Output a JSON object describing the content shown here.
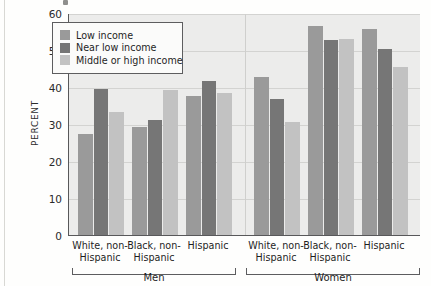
{
  "chart_data": {
    "type": "bar",
    "title": "",
    "xlabel": "",
    "ylabel": "PERCENT",
    "ylim": [
      0,
      60
    ],
    "yticks": [
      0,
      10,
      20,
      30,
      40,
      50,
      60
    ],
    "grid": true,
    "legend_position": "top-left-inside",
    "categories": [
      "White, non-Hispanic",
      "Black, non-Hispanic",
      "Hispanic",
      "White, non-Hispanic",
      "Black, non-Hispanic",
      "Hispanic"
    ],
    "category_lines": [
      [
        "White, non-",
        "Hispanic"
      ],
      [
        "Black, non-",
        "Hispanic"
      ],
      [
        "Hispanic",
        ""
      ],
      [
        "White, non-",
        "Hispanic"
      ],
      [
        "Black, non-",
        "Hispanic"
      ],
      [
        "Hispanic",
        ""
      ]
    ],
    "supergroups": [
      {
        "label": "Men",
        "categories": [
          0,
          1,
          2
        ]
      },
      {
        "label": "Women",
        "categories": [
          3,
          4,
          5
        ]
      }
    ],
    "series": [
      {
        "name": "Low income",
        "color": "#9a9a9a",
        "values": [
          27.3,
          29.2,
          37.6,
          42.7,
          56.5,
          55.7
        ]
      },
      {
        "name": "Near low income",
        "color": "#767676",
        "values": [
          39.5,
          31.1,
          41.6,
          36.8,
          52.7,
          50.3
        ]
      },
      {
        "name": "Middle or high income",
        "color": "#c2c2c2",
        "values": [
          33.2,
          39.2,
          38.4,
          30.5,
          53.0,
          45.4
        ]
      }
    ]
  },
  "axis": {
    "y_title": "PERCENT",
    "y_tick_labels": [
      "60",
      "50",
      "40",
      "30",
      "20",
      "10",
      "0"
    ]
  },
  "legend": {
    "items": [
      {
        "label": "Low income",
        "color": "#9a9a9a"
      },
      {
        "label": "Near low income",
        "color": "#767676"
      },
      {
        "label": "Middle or high income",
        "color": "#c2c2c2"
      }
    ]
  },
  "groups": {
    "men_label": "Men",
    "women_label": "Women"
  }
}
